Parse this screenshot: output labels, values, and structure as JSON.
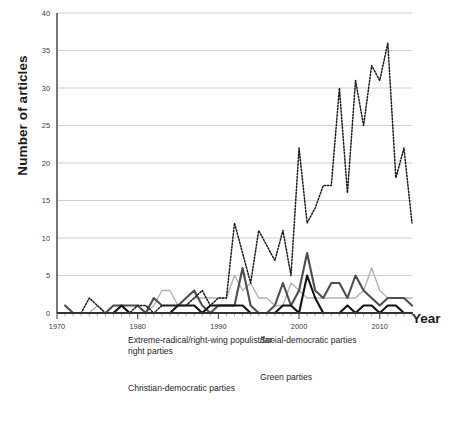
{
  "chart_data": {
    "type": "line",
    "title": "",
    "xlabel": "Year",
    "ylabel": "Number of articles",
    "xlim": [
      1970,
      2014
    ],
    "ylim": [
      0,
      40
    ],
    "ytick_values": [
      0,
      5,
      10,
      15,
      20,
      25,
      30,
      35,
      40
    ],
    "xtick_values": [
      1970,
      1980,
      1990,
      2000,
      2010
    ],
    "xtick_labels": [
      "1970",
      "1980",
      "1990",
      "2000",
      "2010"
    ],
    "ytick_labels": [
      "0",
      "5",
      "10",
      "15",
      "20",
      "25",
      "30",
      "35",
      "40"
    ],
    "grid": "horizontal",
    "legend_position": "below",
    "x": [
      1971,
      1972,
      1973,
      1974,
      1975,
      1976,
      1977,
      1978,
      1979,
      1980,
      1981,
      1982,
      1983,
      1984,
      1985,
      1986,
      1987,
      1988,
      1989,
      1990,
      1991,
      1992,
      1993,
      1994,
      1995,
      1996,
      1997,
      1998,
      1999,
      2000,
      2001,
      2002,
      2003,
      2004,
      2005,
      2006,
      2007,
      2008,
      2009,
      2010,
      2011,
      2012,
      2013,
      2014
    ],
    "series": [
      {
        "name": "Extreme-radical/right-wing populist/far-right parties",
        "key": "far_right",
        "style": "dotted",
        "color": "#1a1a1a",
        "width": 1.5,
        "values": [
          0,
          0,
          0,
          2,
          1,
          0,
          0,
          1,
          0,
          1,
          1,
          0,
          1,
          1,
          1,
          1,
          2,
          3,
          1,
          2,
          2,
          12,
          8,
          4,
          11,
          9,
          7,
          11,
          5,
          22,
          12,
          14,
          17,
          17,
          30,
          16,
          31,
          25,
          33,
          31,
          36,
          18,
          22,
          12
        ]
      },
      {
        "name": "Social-democratic parties",
        "key": "social_democratic",
        "style": "solid",
        "color": "#4d4d4d",
        "width": 2.1,
        "values": [
          1,
          0,
          0,
          0,
          0,
          0,
          1,
          1,
          1,
          1,
          0,
          2,
          1,
          1,
          1,
          2,
          3,
          1,
          0,
          1,
          1,
          1,
          6,
          1,
          0,
          0,
          1,
          4,
          1,
          3,
          8,
          3,
          2,
          4,
          4,
          2,
          5,
          3,
          2,
          1,
          2,
          2,
          2,
          1
        ]
      },
      {
        "name": "Green parties",
        "key": "green",
        "style": "solid",
        "color": "#b3b3b3",
        "width": 1.4,
        "values": [
          0,
          0,
          0,
          0,
          1,
          0,
          0,
          0,
          0,
          0,
          0,
          1,
          3,
          3,
          1,
          1,
          2,
          2,
          2,
          2,
          2,
          5,
          3,
          4,
          2,
          2,
          1,
          1,
          4,
          3,
          2,
          2,
          2,
          2,
          2,
          2,
          2,
          3,
          6,
          3,
          2,
          2,
          2,
          2
        ]
      },
      {
        "name": "Christian-democratic parties",
        "key": "christian_democratic",
        "style": "solid",
        "color": "#111111",
        "width": 2.1,
        "values": [
          0,
          0,
          0,
          0,
          0,
          0,
          0,
          1,
          0,
          0,
          0,
          0,
          0,
          0,
          1,
          1,
          1,
          0,
          1,
          1,
          1,
          1,
          1,
          0,
          0,
          0,
          0,
          1,
          1,
          0,
          5,
          2,
          0,
          0,
          0,
          1,
          0,
          1,
          1,
          0,
          1,
          1,
          0,
          0
        ]
      }
    ]
  },
  "legend": {
    "items": [
      {
        "label": "Extreme-radical/right-wing populist/far-right parties",
        "style": "dotted",
        "color": "#1a1a1a"
      },
      {
        "label": "Christian-democratic parties",
        "style": "solid",
        "color": "#111111"
      },
      {
        "label": "Social-democratic parties",
        "style": "solid",
        "color": "#4d4d4d"
      },
      {
        "label": "Green parties",
        "style": "solid",
        "color": "#b3b3b3"
      }
    ]
  }
}
